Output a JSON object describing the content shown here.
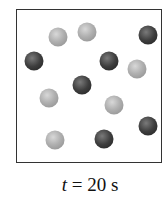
{
  "figure": {
    "caption": {
      "variable": "t",
      "equals": " = ",
      "value": "20 s"
    },
    "particles": [
      {
        "type": "light",
        "x": 58,
        "y": 37
      },
      {
        "type": "light",
        "x": 87,
        "y": 32
      },
      {
        "type": "dark",
        "x": 148,
        "y": 35
      },
      {
        "type": "dark",
        "x": 34,
        "y": 61
      },
      {
        "type": "dark",
        "x": 109,
        "y": 61
      },
      {
        "type": "light",
        "x": 137,
        "y": 69
      },
      {
        "type": "dark",
        "x": 82,
        "y": 85
      },
      {
        "type": "light",
        "x": 49,
        "y": 98
      },
      {
        "type": "light",
        "x": 114,
        "y": 105
      },
      {
        "type": "dark",
        "x": 148,
        "y": 126
      },
      {
        "type": "light",
        "x": 55,
        "y": 140
      },
      {
        "type": "dark",
        "x": 104,
        "y": 139
      }
    ],
    "counts": {
      "light": 6,
      "dark": 6
    },
    "colors": {
      "light": "#b0b0b0",
      "dark": "#3e3e3e",
      "border": "#333333"
    }
  }
}
